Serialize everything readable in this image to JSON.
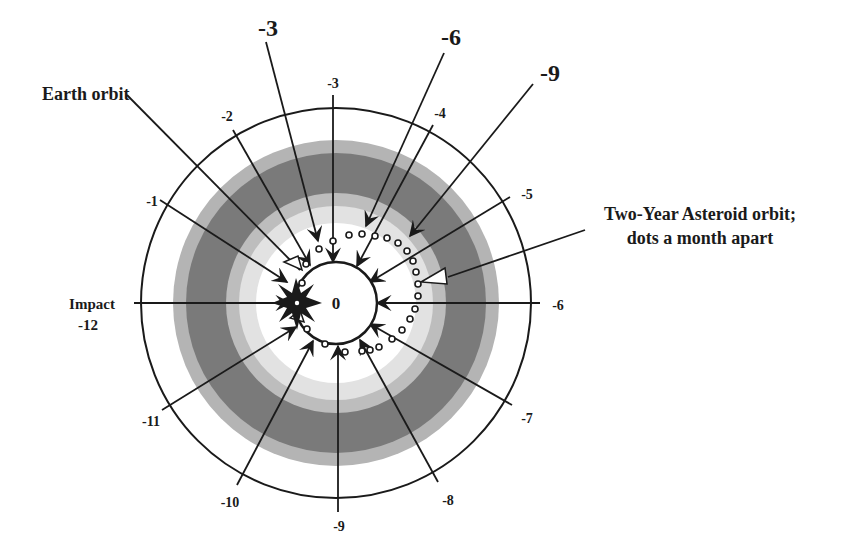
{
  "diagram": {
    "center": {
      "x": 336,
      "y": 303
    },
    "colors": {
      "ink": "#1a1a1a",
      "band_outer_light": "#b4b4b4",
      "band_dark": "#7a7a7a",
      "band_mid_light": "#bdbdbd",
      "band_pale": "#e2e2e2",
      "background": "#ffffff"
    },
    "center_label": "0",
    "earth_orbit_label": "Earth orbit",
    "asteroid_orbit_label_line1": "Two-Year Asteroid orbit;",
    "asteroid_orbit_label_line2": "dots a month apart",
    "impact_label_line1": "Impact",
    "impact_label_line2": "-12",
    "earth_months": [
      {
        "label": "-1",
        "x": 121,
        "y": 175
      },
      {
        "label": "-2",
        "x": 228,
        "y": 119
      },
      {
        "label": "-3",
        "x": 333,
        "y": 87
      },
      {
        "label": "-4",
        "x": 440,
        "y": 118
      },
      {
        "label": "-5",
        "x": 527,
        "y": 198
      },
      {
        "label": "-6",
        "x": 558,
        "y": 310
      },
      {
        "label": "-7",
        "x": 527,
        "y": 423
      },
      {
        "label": "-8",
        "x": 447,
        "y": 505
      },
      {
        "label": "-9",
        "x": 339,
        "y": 531
      },
      {
        "label": "-10",
        "x": 232,
        "y": 507
      },
      {
        "label": "-11",
        "x": 150,
        "y": 422
      }
    ],
    "asteroid_months": [
      {
        "label": "-3",
        "x": 266,
        "y": 38
      },
      {
        "label": "-6",
        "x": 449,
        "y": 46
      },
      {
        "label": "-9",
        "x": 558,
        "y": 80
      }
    ]
  }
}
